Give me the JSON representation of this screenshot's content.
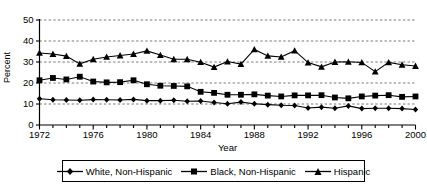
{
  "chart_data": {
    "type": "line",
    "title": "",
    "xlabel": "Year",
    "ylabel": "Percent",
    "xlim": [
      1972,
      2000
    ],
    "ylim": [
      0,
      50
    ],
    "ytick_values": [
      0,
      10,
      20,
      30,
      40,
      50
    ],
    "ytick_labels": [
      "0",
      "10",
      "20",
      "30",
      "40",
      "50"
    ],
    "xtick_labels": [
      "1972",
      "1976",
      "1980",
      "1984",
      "1988",
      "1992",
      "1996",
      "2000"
    ],
    "xtick_values": [
      1972,
      1976,
      1980,
      1984,
      1988,
      1992,
      1996,
      2000
    ],
    "xtick_minor_step": 1,
    "grid": "horizontal-dashed",
    "legend_position": "bottom",
    "x": [
      1972,
      1973,
      1974,
      1975,
      1976,
      1977,
      1978,
      1979,
      1980,
      1981,
      1982,
      1983,
      1984,
      1985,
      1986,
      1987,
      1988,
      1989,
      1990,
      1991,
      1992,
      1993,
      1994,
      1995,
      1996,
      1997,
      1998,
      1999,
      2000
    ],
    "series": [
      {
        "name": "White, Non-Hispanic",
        "marker": "diamond",
        "color": "#000000",
        "values": [
          12.5,
          12.0,
          11.9,
          11.8,
          12.1,
          12.0,
          11.9,
          12.2,
          11.6,
          11.6,
          11.8,
          11.3,
          11.4,
          10.7,
          10.1,
          10.9,
          10.1,
          9.7,
          9.4,
          9.3,
          8.1,
          8.5,
          8.0,
          9.1,
          7.8,
          8.0,
          8.0,
          7.8,
          7.4
        ]
      },
      {
        "name": "Black, Non-Hispanic",
        "marker": "square",
        "color": "#000000",
        "values": [
          21.3,
          22.4,
          21.7,
          23.0,
          20.7,
          20.3,
          20.4,
          21.3,
          19.4,
          18.7,
          18.6,
          18.4,
          15.8,
          15.3,
          14.4,
          14.4,
          14.6,
          14.0,
          13.6,
          14.1,
          14.1,
          14.2,
          13.1,
          12.7,
          13.6,
          14.0,
          14.2,
          13.4,
          13.6
        ]
      },
      {
        "name": "Hispanic",
        "marker": "triangle",
        "color": "#000000",
        "values": [
          34.3,
          33.8,
          32.8,
          29.1,
          31.3,
          32.4,
          33.1,
          33.8,
          35.3,
          33.3,
          31.3,
          31.3,
          29.9,
          27.6,
          30.2,
          29.0,
          36.0,
          32.9,
          32.4,
          35.4,
          29.7,
          27.7,
          30.0,
          30.1,
          29.8,
          25.4,
          29.8,
          28.7,
          28.1
        ]
      }
    ]
  },
  "legend": {
    "items": [
      {
        "label": "White, Non-Hispanic",
        "marker": "diamond-marker-icon"
      },
      {
        "label": "Black, Non-Hispanic",
        "marker": "square-marker-icon"
      },
      {
        "label": "Hispanic",
        "marker": "triangle-marker-icon"
      }
    ]
  }
}
